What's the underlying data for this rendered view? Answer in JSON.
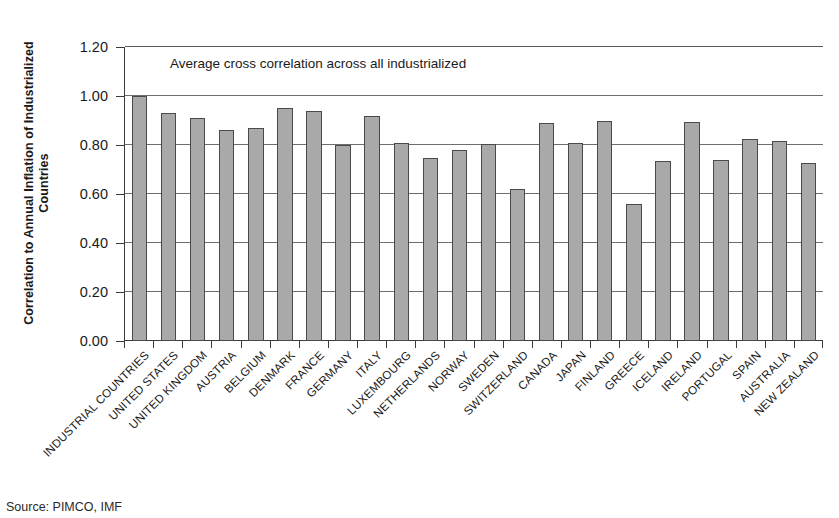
{
  "chart_data": {
    "type": "bar",
    "title": "",
    "annotation": "Average cross correlation across all industrialized",
    "xlabel": "",
    "ylabel": "Correlation to Annual Inflation of Industrialized Countries",
    "ylabel_line1": "Correlation to Annual Inflation of Industrialized",
    "ylabel_line2": "Countries",
    "ylim": [
      0.0,
      1.2
    ],
    "ytick_labels": [
      "0.00",
      "0.20",
      "0.40",
      "0.60",
      "0.80",
      "1.00",
      "1.20"
    ],
    "ytick_values": [
      0.0,
      0.2,
      0.4,
      0.6,
      0.8,
      1.0,
      1.2
    ],
    "grid": true,
    "legend": "none",
    "bar_color": "#a9a9a9",
    "bar_edge_color": "#4a4a4a",
    "axis_color": "#3b3b3b",
    "categories": [
      "INDUSTRIAL COUNTRIES",
      "UNITED STATES",
      "UNITED KINGDOM",
      "AUSTRIA",
      "BELGIUM",
      "DENMARK",
      "FRANCE",
      "GERMANY",
      "ITALY",
      "LUXEMBOURG",
      "NETHERLANDS",
      "NORWAY",
      "SWEDEN",
      "SWITZERLAND",
      "CANADA",
      "JAPAN",
      "FINLAND",
      "GREECE",
      "ICELAND",
      "IRELAND",
      "PORTUGAL",
      "SPAIN",
      "AUSTRALIA",
      "NEW ZEALAND"
    ],
    "values": [
      1.0,
      0.93,
      0.91,
      0.86,
      0.87,
      0.95,
      0.94,
      0.8,
      0.92,
      0.81,
      0.745,
      0.78,
      0.805,
      0.62,
      0.89,
      0.81,
      0.9,
      0.56,
      0.735,
      0.895,
      0.74,
      0.825,
      0.815,
      0.725
    ]
  },
  "source_note": "Source: PIMCO, IMF"
}
